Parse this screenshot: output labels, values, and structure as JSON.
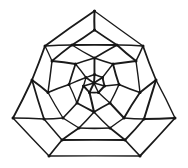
{
  "figure": {
    "type": "line-drawing",
    "width": 188,
    "height": 168,
    "background_color": "#ffffff",
    "line_color": "#1a1a1a",
    "vertex_color": "#141414",
    "stroke_width": 1.6,
    "vertex_radius": 1.5,
    "symmetry": "3-fold rotational",
    "vertex_count": 40,
    "edge_count": 60,
    "face_count": 22
  },
  "graph_data": {
    "type": "planar-graph",
    "vertices": [
      {
        "id": "c0",
        "x": 94.0,
        "y": 83.0,
        "ring": "center",
        "label": ""
      },
      {
        "id": "h1",
        "x": 94.5,
        "y": 74.5,
        "ring": "hub",
        "label": ""
      },
      {
        "id": "h2",
        "x": 102.5,
        "y": 77.5,
        "ring": "hub",
        "label": ""
      },
      {
        "id": "h3",
        "x": 104.5,
        "y": 86.0,
        "ring": "hub",
        "label": ""
      },
      {
        "id": "h4",
        "x": 98.5,
        "y": 92.5,
        "ring": "hub",
        "label": ""
      },
      {
        "id": "h5",
        "x": 89.5,
        "y": 92.5,
        "ring": "hub",
        "label": ""
      },
      {
        "id": "h6",
        "x": 83.5,
        "y": 86.0,
        "ring": "hub",
        "label": ""
      },
      {
        "id": "h7",
        "x": 86.0,
        "y": 77.5,
        "ring": "hub",
        "label": ""
      },
      {
        "id": "r1a",
        "x": 94.5,
        "y": 58.0,
        "ring": "inner",
        "label": ""
      },
      {
        "id": "r1b",
        "x": 113.0,
        "y": 64.0,
        "ring": "inner",
        "label": ""
      },
      {
        "id": "r1c",
        "x": 119.0,
        "y": 84.5,
        "ring": "inner",
        "label": ""
      },
      {
        "id": "r1d",
        "x": 110.0,
        "y": 103.0,
        "ring": "inner",
        "label": ""
      },
      {
        "id": "r1e",
        "x": 94.0,
        "y": 112.0,
        "ring": "inner",
        "label": ""
      },
      {
        "id": "r1f",
        "x": 77.0,
        "y": 103.0,
        "ring": "inner",
        "label": ""
      },
      {
        "id": "r1g",
        "x": 69.0,
        "y": 84.5,
        "ring": "inner",
        "label": ""
      },
      {
        "id": "r1h",
        "x": 75.5,
        "y": 64.0,
        "ring": "inner",
        "label": ""
      },
      {
        "id": "r2a",
        "x": 72.0,
        "y": 45.0,
        "ring": "middle",
        "label": ""
      },
      {
        "id": "r2b",
        "x": 117.0,
        "y": 45.0,
        "ring": "middle",
        "label": ""
      },
      {
        "id": "r2c",
        "x": 136.0,
        "y": 61.0,
        "ring": "middle",
        "label": ""
      },
      {
        "id": "r2d",
        "x": 140.0,
        "y": 92.5,
        "ring": "middle",
        "label": ""
      },
      {
        "id": "r2e",
        "x": 124.0,
        "y": 118.0,
        "ring": "middle",
        "label": ""
      },
      {
        "id": "r2f",
        "x": 110.0,
        "y": 128.0,
        "ring": "middle",
        "label": ""
      },
      {
        "id": "r2g",
        "x": 79.0,
        "y": 128.0,
        "ring": "middle",
        "label": ""
      },
      {
        "id": "r2h",
        "x": 63.0,
        "y": 118.0,
        "ring": "middle",
        "label": ""
      },
      {
        "id": "r2i",
        "x": 48.0,
        "y": 92.5,
        "ring": "middle",
        "label": ""
      },
      {
        "id": "r2j",
        "x": 52.0,
        "y": 61.0,
        "ring": "middle",
        "label": ""
      },
      {
        "id": "r3a",
        "x": 94.5,
        "y": 30.0,
        "ring": "outer-inner",
        "label": ""
      },
      {
        "id": "r3b",
        "x": 143.0,
        "y": 46.0,
        "ring": "outer-inner",
        "label": ""
      },
      {
        "id": "r3c",
        "x": 156.0,
        "y": 80.0,
        "ring": "outer-inner",
        "label": ""
      },
      {
        "id": "r3d",
        "x": 144.0,
        "y": 119.0,
        "ring": "outer-inner",
        "label": ""
      },
      {
        "id": "r3e",
        "x": 125.0,
        "y": 140.0,
        "ring": "outer-inner",
        "label": ""
      },
      {
        "id": "r3f",
        "x": 62.0,
        "y": 140.0,
        "ring": "outer-inner",
        "label": ""
      },
      {
        "id": "r3g",
        "x": 44.0,
        "y": 119.0,
        "ring": "outer-inner",
        "label": ""
      },
      {
        "id": "r3h",
        "x": 32.0,
        "y": 80.0,
        "ring": "outer-inner",
        "label": ""
      },
      {
        "id": "r3i",
        "x": 45.0,
        "y": 46.0,
        "ring": "outer-inner",
        "label": ""
      },
      {
        "id": "b1",
        "x": 94.5,
        "y": 11.0,
        "ring": "boundary",
        "label": "apex-top"
      },
      {
        "id": "b2",
        "x": 175.0,
        "y": 118.0,
        "ring": "boundary",
        "label": "apex-right"
      },
      {
        "id": "b3",
        "x": 140.0,
        "y": 156.0,
        "ring": "boundary",
        "label": "corner-bottom-right"
      },
      {
        "id": "b4",
        "x": 49.0,
        "y": 156.0,
        "ring": "boundary",
        "label": "corner-bottom-left"
      },
      {
        "id": "b5",
        "x": 13.0,
        "y": 118.0,
        "ring": "boundary",
        "label": "apex-left"
      }
    ],
    "edges": [
      [
        "c0",
        "h1"
      ],
      [
        "c0",
        "h2"
      ],
      [
        "c0",
        "h3"
      ],
      [
        "c0",
        "h4"
      ],
      [
        "c0",
        "h5"
      ],
      [
        "c0",
        "h6"
      ],
      [
        "c0",
        "h7"
      ],
      [
        "h1",
        "h2"
      ],
      [
        "h2",
        "h3"
      ],
      [
        "h3",
        "h4"
      ],
      [
        "h4",
        "h5"
      ],
      [
        "h5",
        "h6"
      ],
      [
        "h6",
        "h7"
      ],
      [
        "h7",
        "h1"
      ],
      [
        "h1",
        "r1a"
      ],
      [
        "h2",
        "r1b"
      ],
      [
        "h3",
        "r1c"
      ],
      [
        "h4",
        "r1d"
      ],
      [
        "h5",
        "r1e"
      ],
      [
        "h6",
        "r1f"
      ],
      [
        "h7",
        "r1g"
      ],
      [
        "h7",
        "r1h"
      ],
      [
        "r1a",
        "r1b"
      ],
      [
        "r1b",
        "r1c"
      ],
      [
        "r1c",
        "r1d"
      ],
      [
        "r1d",
        "r1e"
      ],
      [
        "r1e",
        "r1f"
      ],
      [
        "r1f",
        "r1g"
      ],
      [
        "r1g",
        "r1h"
      ],
      [
        "r1h",
        "r1a"
      ],
      [
        "r1a",
        "r2a"
      ],
      [
        "r1a",
        "r2b"
      ],
      [
        "r1b",
        "r2c"
      ],
      [
        "r1c",
        "r2d"
      ],
      [
        "r1d",
        "r2e"
      ],
      [
        "r1e",
        "r2f"
      ],
      [
        "r1e",
        "r2g"
      ],
      [
        "r1f",
        "r2h"
      ],
      [
        "r1g",
        "r2i"
      ],
      [
        "r1h",
        "r2j"
      ],
      [
        "r2a",
        "r2b"
      ],
      [
        "r2b",
        "r2c"
      ],
      [
        "r2c",
        "r2d"
      ],
      [
        "r2d",
        "r2e"
      ],
      [
        "r2e",
        "r2f"
      ],
      [
        "r2f",
        "r2g"
      ],
      [
        "r2g",
        "r2h"
      ],
      [
        "r2h",
        "r2i"
      ],
      [
        "r2i",
        "r2j"
      ],
      [
        "r2j",
        "r2a"
      ],
      [
        "r2a",
        "r3i"
      ],
      [
        "r2a",
        "r3a"
      ],
      [
        "r2b",
        "r3a"
      ],
      [
        "r2b",
        "r3b"
      ],
      [
        "r2c",
        "r3b"
      ],
      [
        "r2d",
        "r3c"
      ],
      [
        "r2e",
        "r3d"
      ],
      [
        "r2f",
        "r3e"
      ],
      [
        "r2g",
        "r3f"
      ],
      [
        "r2h",
        "r3g"
      ],
      [
        "r2i",
        "r3h"
      ],
      [
        "r2j",
        "r3i"
      ],
      [
        "r3a",
        "b1"
      ],
      [
        "r3b",
        "b1"
      ],
      [
        "r3i",
        "b1"
      ],
      [
        "r3b",
        "r3c"
      ],
      [
        "r3c",
        "b2"
      ],
      [
        "r3d",
        "b2"
      ],
      [
        "r3c",
        "r3d"
      ],
      [
        "r3d",
        "r3e"
      ],
      [
        "r3e",
        "b3"
      ],
      [
        "r3e",
        "r3f"
      ],
      [
        "r3f",
        "r3g"
      ],
      [
        "r3f",
        "b4"
      ],
      [
        "r3g",
        "b5"
      ],
      [
        "r3h",
        "b5"
      ],
      [
        "r3g",
        "r3h"
      ],
      [
        "r3h",
        "r3i"
      ],
      [
        "b1",
        "r3b"
      ],
      [
        "b2",
        "b3"
      ],
      [
        "b3",
        "b4"
      ],
      [
        "b4",
        "b5"
      ]
    ]
  }
}
